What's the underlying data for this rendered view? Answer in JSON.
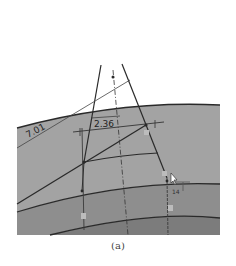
{
  "figure": {
    "caption": "(a)",
    "dimensions": {
      "left": "7.01",
      "top": "2.36",
      "right_small": "14"
    },
    "colors": {
      "background": "#ffffff",
      "upper_layer": "#a3a3a3",
      "middle_layer": "#8c8c8c",
      "lower_layer": "#7e7e7e",
      "line": "#2a2a2a",
      "thin_line": "#4a4a4a",
      "label": "#222222"
    }
  }
}
